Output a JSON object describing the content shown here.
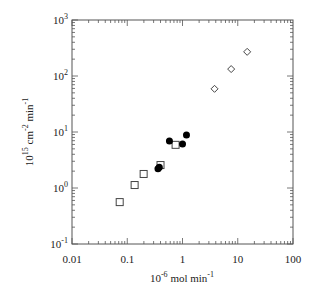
{
  "chart_data": {
    "type": "scatter",
    "title": "",
    "xlabel": "10^-6 mol min^-1",
    "ylabel": "10^15 cm^-2 min^-1",
    "xscale": "log",
    "yscale": "log",
    "xlim": [
      0.01,
      100
    ],
    "ylim": [
      0.1,
      1000
    ],
    "x_ticks": [
      "0.01",
      "0.1",
      "1",
      "10",
      "100"
    ],
    "y_ticks": [
      {
        "base": "10",
        "exp": "-1"
      },
      {
        "base": "10",
        "exp": "0"
      },
      {
        "base": "10",
        "exp": "1"
      },
      {
        "base": "10",
        "exp": "2"
      },
      {
        "base": "10",
        "exp": "3"
      }
    ],
    "grid": false,
    "legend": null,
    "series": [
      {
        "name": "open squares",
        "marker": "square-open",
        "points": [
          {
            "x": 0.073,
            "y": 0.56
          },
          {
            "x": 0.136,
            "y": 1.13
          },
          {
            "x": 0.198,
            "y": 1.78
          },
          {
            "x": 0.4,
            "y": 2.57
          },
          {
            "x": 0.75,
            "y": 5.9
          }
        ]
      },
      {
        "name": "filled circles",
        "marker": "circle-filled",
        "points": [
          {
            "x": 0.36,
            "y": 2.2
          },
          {
            "x": 0.38,
            "y": 2.35
          },
          {
            "x": 0.58,
            "y": 6.9
          },
          {
            "x": 1.0,
            "y": 6.1
          },
          {
            "x": 1.18,
            "y": 8.8
          }
        ]
      },
      {
        "name": "open diamonds",
        "marker": "diamond-open",
        "points": [
          {
            "x": 3.8,
            "y": 59
          },
          {
            "x": 7.6,
            "y": 133
          },
          {
            "x": 14.8,
            "y": 270
          }
        ]
      }
    ]
  },
  "labels": {
    "x_title_base": "10",
    "x_title_exp": "-6",
    "x_title_rest": " mol min",
    "x_title_rest_exp": "-1",
    "y_title_base": "10",
    "y_title_exp": "15",
    "y_title_mid": " cm",
    "y_title_mid_exp": "-2",
    "y_title_rest": " min",
    "y_title_rest_exp": "-1"
  }
}
